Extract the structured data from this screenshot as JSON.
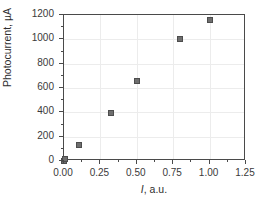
{
  "chart_data": {
    "type": "scatter",
    "title": "",
    "xlabel": "I, a.u.",
    "xlabel_italic_part": "I",
    "xlabel_rest": ", a.u.",
    "ylabel": "Photocurrent, µA",
    "xlim": [
      0.0,
      1.25
    ],
    "ylim": [
      0,
      1200
    ],
    "grid": true,
    "legend": "none",
    "marker": "square",
    "marker_color": "#6e6e6e",
    "marker_edge_color": "#4d4d4d",
    "frame_color": "#4a4a4a",
    "grid_color": "#ececec",
    "xticks": [
      "0.00",
      "0.25",
      "0.50",
      "0.75",
      "1.00",
      "1.25"
    ],
    "xtick_values": [
      0.0,
      0.25,
      0.5,
      0.75,
      1.0,
      1.25
    ],
    "yticks": [
      "0",
      "200",
      "400",
      "600",
      "800",
      "1000",
      "1200"
    ],
    "ytick_values": [
      0,
      200,
      400,
      600,
      800,
      1000,
      1200
    ],
    "x": [
      0.0,
      0.01,
      0.1,
      0.32,
      0.5,
      0.8,
      1.0
    ],
    "y": [
      0,
      20,
      130,
      395,
      655,
      1005,
      1160
    ],
    "points": [
      {
        "x": 0.0,
        "y": 0
      },
      {
        "x": 0.01,
        "y": 20
      },
      {
        "x": 0.1,
        "y": 130
      },
      {
        "x": 0.32,
        "y": 395
      },
      {
        "x": 0.5,
        "y": 655
      },
      {
        "x": 0.8,
        "y": 1005
      },
      {
        "x": 1.0,
        "y": 1160
      }
    ]
  }
}
